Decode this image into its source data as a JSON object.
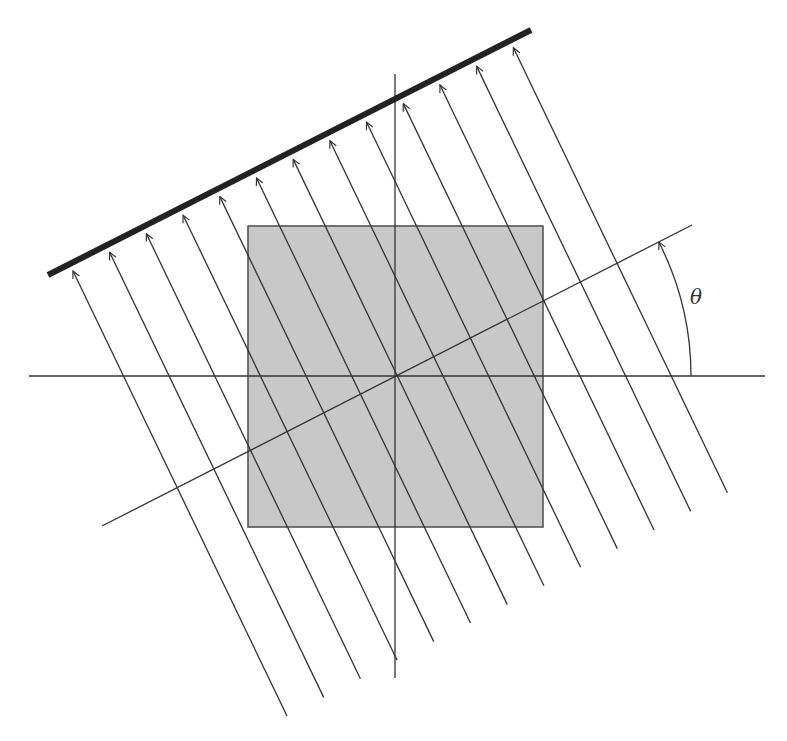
{
  "diagram": {
    "angle_label": "θ",
    "colors": {
      "line": "#333333",
      "detector": "#222222",
      "object_fill": "#c8c8c8",
      "object_stroke": "#555555",
      "background": "#ffffff"
    },
    "axes": {
      "horizontal": {
        "x1": 29,
        "y1": 376,
        "x2": 765,
        "y2": 376
      },
      "vertical": {
        "x1": 395,
        "y1": 74,
        "x2": 395,
        "y2": 678
      },
      "rotated": {
        "x1": 102,
        "y1": 526,
        "x2": 692,
        "y2": 225
      }
    },
    "object": {
      "shape": "square",
      "x": 248,
      "y": 226,
      "width": 295,
      "height": 301
    },
    "detector": {
      "x1": 48,
      "y1": 275,
      "x2": 531,
      "y2": 30,
      "stroke_width": 6
    },
    "rays": {
      "count": 13,
      "first_tip": {
        "x": 73,
        "y": 271
      },
      "tip_step": {
        "dx": 36.7,
        "dy": -18.6
      },
      "direction": {
        "dx": 214,
        "dy": 445
      },
      "has_arrowheads": true
    },
    "angle_arc": {
      "cx": 396,
      "cy": 376,
      "radius": 295,
      "start_deg": 0,
      "end_deg": 27,
      "label_x": 690,
      "label_y": 285
    }
  }
}
